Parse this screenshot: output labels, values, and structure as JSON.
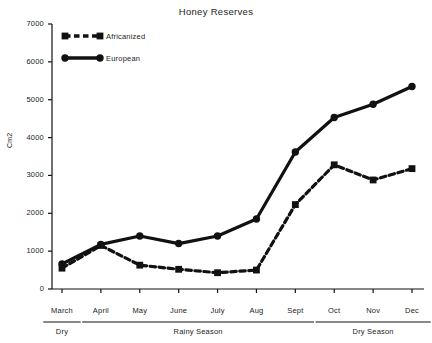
{
  "chart_data": {
    "type": "line",
    "title": "Honey Reserves",
    "xlabel": "",
    "ylabel": "Cm2",
    "categories": [
      "March",
      "April",
      "May",
      "June",
      "July",
      "Aug",
      "Sept",
      "Oct",
      "Nov",
      "Dec"
    ],
    "series": [
      {
        "name": "Africanized",
        "style": "dashed",
        "marker": "square",
        "values": [
          550,
          1150,
          630,
          520,
          430,
          500,
          2230,
          3280,
          2880,
          3180
        ]
      },
      {
        "name": "European",
        "style": "solid",
        "marker": "circle",
        "values": [
          660,
          1180,
          1400,
          1200,
          1400,
          1850,
          3620,
          4530,
          4880,
          5350
        ]
      }
    ],
    "ylim": [
      0,
      7000
    ],
    "yticks": [
      0,
      1000,
      2000,
      3000,
      4000,
      5000,
      6000,
      7000
    ],
    "ytick_labels": [
      "0",
      "1000",
      "2000",
      "3000",
      "4000",
      "5000",
      "6000",
      "7000"
    ],
    "grid": false,
    "legend_position": "upper-left-inside",
    "seasons": [
      {
        "label": "Dry",
        "start_category": "March",
        "end_category": "March"
      },
      {
        "label": "Rainy Season",
        "start_category": "April",
        "end_category": "Sept"
      },
      {
        "label": "Dry Season",
        "start_category": "Oct",
        "end_category": "Dec"
      }
    ],
    "line_color": "#111111"
  },
  "legend": {
    "items": [
      {
        "label": "Africanized"
      },
      {
        "label": "European"
      }
    ]
  }
}
